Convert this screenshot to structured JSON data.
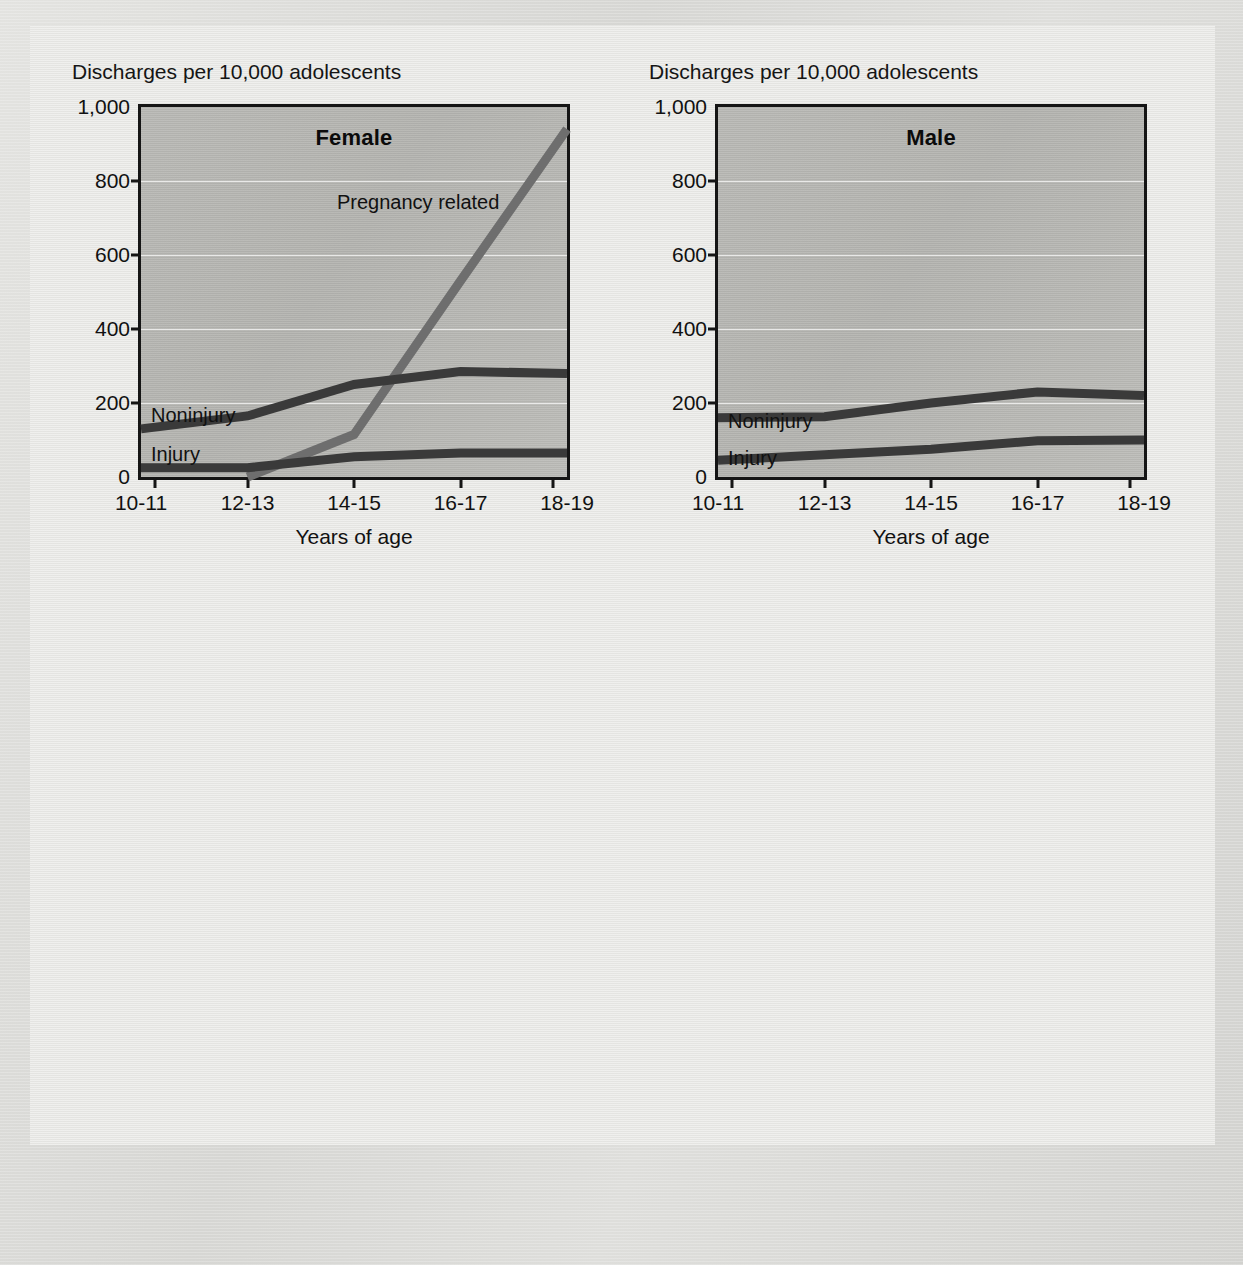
{
  "figure": {
    "y_axis_caption": "Discharges per 10,000 adolescents",
    "x_axis_title": "Years of age"
  },
  "chart_data": [
    {
      "type": "line",
      "title": "Female",
      "xlabel": "Years of age",
      "ylabel": "Discharges per 10,000 adolescents",
      "categories": [
        "10-11",
        "12-13",
        "14-15",
        "16-17",
        "18-19"
      ],
      "yticks": [
        "0",
        "200",
        "400",
        "600",
        "800",
        "1,000"
      ],
      "ylim": [
        0,
        1000
      ],
      "grid": true,
      "legend": "inline-labels",
      "series": [
        {
          "name": "Pregnancy related",
          "values": [
            null,
            0,
            115,
            530,
            940
          ],
          "color": "#6e6e6e"
        },
        {
          "name": "Noninjury",
          "values": [
            130,
            165,
            250,
            285,
            280
          ],
          "color": "#3a3a3a"
        },
        {
          "name": "Injury",
          "values": [
            25,
            25,
            55,
            65,
            65
          ],
          "color": "#3a3a3a"
        }
      ]
    },
    {
      "type": "line",
      "title": "Male",
      "xlabel": "Years of age",
      "ylabel": "Discharges per 10,000 adolescents",
      "categories": [
        "10-11",
        "12-13",
        "14-15",
        "16-17",
        "18-19"
      ],
      "yticks": [
        "0",
        "200",
        "400",
        "600",
        "800",
        "1,000"
      ],
      "ylim": [
        0,
        1000
      ],
      "grid": true,
      "legend": "inline-labels",
      "series": [
        {
          "name": "Noninjury",
          "values": [
            160,
            163,
            200,
            230,
            220
          ],
          "color": "#3a3a3a"
        },
        {
          "name": "Injury",
          "values": [
            45,
            60,
            75,
            98,
            100
          ],
          "color": "#3a3a3a"
        }
      ]
    }
  ],
  "left": {
    "caption": "Discharges per 10,000 adolescents",
    "title": "Female",
    "xtitle": "Years of age",
    "yticks": [
      "1,000",
      "800",
      "600",
      "400",
      "200",
      "0"
    ],
    "xticks": [
      "10-11",
      "12-13",
      "14-15",
      "16-17",
      "18-19"
    ],
    "labels": {
      "pregnancy": "Pregnancy related",
      "noninjury": "Noninjury",
      "injury": "Injury"
    }
  },
  "right": {
    "caption": "Discharges per 10,000 adolescents",
    "title": "Male",
    "xtitle": "Years of age",
    "yticks": [
      "1,000",
      "800",
      "600",
      "400",
      "200",
      "0"
    ],
    "xticks": [
      "10-11",
      "12-13",
      "14-15",
      "16-17",
      "18-19"
    ],
    "labels": {
      "noninjury": "Noninjury",
      "injury": "Injury"
    }
  },
  "colors": {
    "line_dark": "#3a3a3a",
    "line_mid": "#6e6e6e",
    "axis": "#151515",
    "plot_fill": "#b6b6b2",
    "card": "#e9e9e6",
    "page": "#d9d9d6"
  }
}
